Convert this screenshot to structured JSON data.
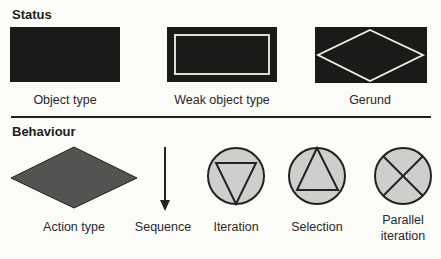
{
  "sections": {
    "status": {
      "heading": "Status",
      "items": [
        {
          "label": "Object type",
          "shape": "filled-rectangle"
        },
        {
          "label": "Weak object type",
          "shape": "double-border-rectangle"
        },
        {
          "label": "Gerund",
          "shape": "rectangle-with-diamond"
        }
      ]
    },
    "behaviour": {
      "heading": "Behaviour",
      "items": [
        {
          "label": "Action type",
          "shape": "filled-diamond"
        },
        {
          "label": "Sequence",
          "shape": "down-arrow"
        },
        {
          "label": "Iteration",
          "shape": "circle-inverted-triangle"
        },
        {
          "label": "Selection",
          "shape": "circle-triangle"
        },
        {
          "label_line1": "Parallel",
          "label_line2": "iteration",
          "shape": "circle-cross"
        }
      ]
    }
  },
  "colors": {
    "dark_fill": "#1c1a19",
    "diamond_fill": "#555352",
    "circle_fill": "#cfcecc",
    "stroke": "#222222",
    "background": "#fbfbf8"
  }
}
